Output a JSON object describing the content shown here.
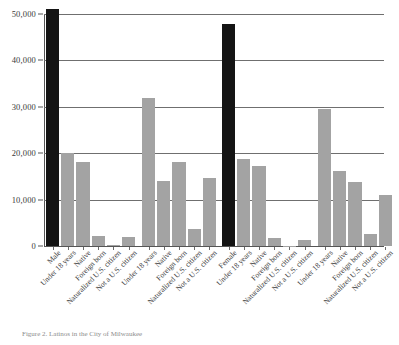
{
  "figure": {
    "caption": "Figure 2.  Latinos in the City of Milwaukee"
  },
  "chart_data": {
    "type": "bar",
    "title": "",
    "xlabel": "",
    "ylabel": "",
    "ylim": [
      0,
      50000
    ],
    "grid": true,
    "legend": "none",
    "y_ticks": [
      0,
      10000,
      20000,
      30000,
      40000,
      50000
    ],
    "y_tick_labels": [
      "0",
      "10,000",
      "20,000",
      "30,000",
      "40,000",
      "50,000"
    ],
    "categories": [
      "Male",
      "Under 18 years",
      "Native",
      "Foreign born",
      "Naturalized U.S. citizen",
      "Not a U.S. citizen",
      "Female",
      "Under 18 years",
      "Native",
      "Foreign born",
      "Naturalized U.S. citizen",
      "Not a U.S. citizen"
    ],
    "values": [
      51100,
      20100,
      18200,
      2100,
      200,
      1900,
      47900,
      18800,
      17200,
      1800,
      100,
      1400
    ],
    "groups": [
      {
        "name": "Male",
        "total": 51100,
        "bars": [
          {
            "label": "Male",
            "value": 51100,
            "highlight": true
          },
          {
            "label": "Under 18 years",
            "value": 20100,
            "highlight": false
          },
          {
            "label": "Native",
            "value": 18200,
            "highlight": false
          },
          {
            "label": "Foreign born",
            "value": 2100,
            "highlight": false
          },
          {
            "label": "Naturalized U.S. citizen",
            "value": 200,
            "highlight": false
          },
          {
            "label": "Not a U.S. citizen",
            "value": 1900,
            "highlight": false
          }
        ]
      },
      {
        "name": "Male (detail)",
        "bars": [
          {
            "label": "Under 18 years",
            "value": 31900,
            "highlight": false
          },
          {
            "label": "Native",
            "value": 14000,
            "highlight": false
          },
          {
            "label": "Foreign born",
            "value": 18000,
            "highlight": false
          },
          {
            "label": "Naturalized U.S. citizen",
            "value": 3700,
            "highlight": false
          },
          {
            "label": "Not a U.S. citizen",
            "value": 14600,
            "highlight": false
          }
        ]
      },
      {
        "name": "Female",
        "total": 47900,
        "bars": [
          {
            "label": "Female",
            "value": 47900,
            "highlight": true
          },
          {
            "label": "Under 18 years",
            "value": 18800,
            "highlight": false
          },
          {
            "label": "Native",
            "value": 17200,
            "highlight": false
          },
          {
            "label": "Foreign born",
            "value": 1800,
            "highlight": false
          },
          {
            "label": "Naturalized U.S. citizen",
            "value": 100,
            "highlight": false
          },
          {
            "label": "Not a U.S. citizen",
            "value": 1400,
            "highlight": false
          }
        ]
      },
      {
        "name": "Female (detail)",
        "bars": [
          {
            "label": "Under 18 years",
            "value": 29500,
            "highlight": false
          },
          {
            "label": "Native",
            "value": 16200,
            "highlight": false
          },
          {
            "label": "Foreign born",
            "value": 13700,
            "highlight": false
          },
          {
            "label": "Naturalized U.S. citizen",
            "value": 2600,
            "highlight": false
          },
          {
            "label": "Not a U.S. citizen",
            "value": 11100,
            "highlight": false
          }
        ]
      }
    ],
    "colors": {
      "highlight_bar": "#141414",
      "bar": "#a3a3a3",
      "gridline": "#6f6f6f",
      "axis": "#555555",
      "text": "#3a3a3a",
      "caption": "#8c8c8c",
      "background": "#ffffff"
    }
  }
}
